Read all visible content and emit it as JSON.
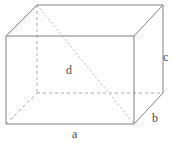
{
  "figure": {
    "name": "rectangular-prism-diagram",
    "shape": "cuboid",
    "projection": "oblique",
    "width_px": 174,
    "height_px": 143,
    "background_color": "#ffffff",
    "solid_edge_color": "#808080",
    "hidden_edge_color": "#a8a8a8",
    "diagonal_color": "#b4b4b4",
    "label_color": "#4a4a4a"
  },
  "labels": {
    "a": "a",
    "b": "b",
    "c": "c",
    "d": "d"
  },
  "geometry": {
    "front_face": {
      "top_left": [
        6,
        36
      ],
      "top_right": [
        134,
        36
      ],
      "bottom_right": [
        134,
        124
      ],
      "bottom_left": [
        6,
        124
      ]
    },
    "back_face": {
      "top_left": [
        37,
        5
      ],
      "top_right": [
        163,
        5
      ],
      "bottom_right": [
        163,
        93
      ],
      "bottom_left": [
        37,
        93
      ]
    },
    "depth_offset": [
      31,
      -31
    ],
    "space_diagonal": {
      "from": [
        37,
        5
      ],
      "to": [
        134,
        124
      ]
    }
  },
  "edges": {
    "solid": [
      "front-top",
      "front-right",
      "front-bottom",
      "front-left",
      "back-top",
      "back-right",
      "top-left-connector",
      "top-right-connector",
      "bottom-right-connector"
    ],
    "hidden": [
      "back-left-vertical",
      "back-bottom",
      "bottom-left-connector"
    ]
  }
}
